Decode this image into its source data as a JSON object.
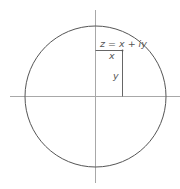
{
  "diagram": {
    "title_label": "z = x + iy",
    "x_label": "x",
    "y_label": "y",
    "colors": {
      "background": "#ffffff",
      "axis": "#9a9a9a",
      "circle": "#555555",
      "text": "#555555"
    },
    "elements": [
      "horizontal-axis",
      "vertical-axis",
      "circle",
      "projection-rectangle"
    ]
  }
}
